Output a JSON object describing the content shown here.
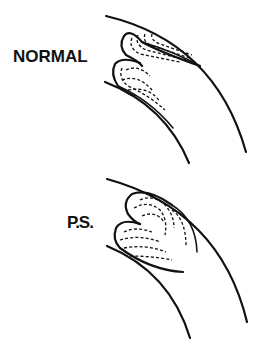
{
  "figure": {
    "panels": [
      {
        "id": "normal",
        "label": "NORMAL"
      },
      {
        "id": "ps",
        "label": "P.S."
      }
    ]
  }
}
